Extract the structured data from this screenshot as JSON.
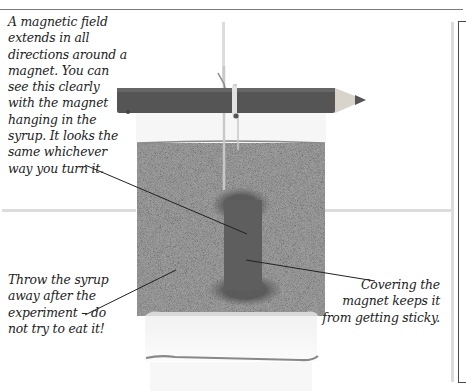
{
  "figure": {
    "colors": {
      "rule": "#7a7a7a",
      "grid_lines": "#dcdcdc",
      "pencil": "#555555",
      "syrup": "#9a9a9a",
      "magnet": "#5a5a5a",
      "leader_lines": "#222222",
      "frame": "#4a4a4a"
    }
  },
  "captions": {
    "top_left": "A magnetic field extends in all directions around a magnet. You can see this clearly with the magnet hanging in the syrup. It looks the same whichever way you turn it.",
    "bottom_left": "Throw the syrup away after the experiment – do not try to eat it!",
    "right": "Covering the magnet keeps it from getting sticky."
  }
}
